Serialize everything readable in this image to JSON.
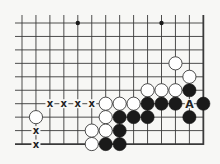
{
  "diagram": {
    "type": "go-board-fragment",
    "columns": 14,
    "rows": 10,
    "edges": {
      "right": true,
      "bottom": true,
      "left": false,
      "top": false
    },
    "colors": {
      "background": "#f7f7f5",
      "line": "#3a3a3a",
      "black_stone": "#1a1a1a",
      "white_stone": "#ffffff",
      "label": "#222222"
    },
    "star_points": [
      [
        4,
        0
      ],
      [
        10,
        0
      ]
    ],
    "white_stones": [
      [
        11,
        3
      ],
      [
        12,
        4
      ],
      [
        9,
        5
      ],
      [
        10,
        5
      ],
      [
        11,
        5
      ],
      [
        6,
        6
      ],
      [
        7,
        6
      ],
      [
        8,
        6
      ],
      [
        6,
        7
      ],
      [
        5,
        8
      ],
      [
        6,
        8
      ],
      [
        5,
        9
      ],
      [
        1,
        7
      ]
    ],
    "black_stones": [
      [
        12,
        5
      ],
      [
        9,
        6
      ],
      [
        10,
        6
      ],
      [
        11,
        6
      ],
      [
        13,
        6
      ],
      [
        7,
        7
      ],
      [
        8,
        7
      ],
      [
        9,
        7
      ],
      [
        12,
        7
      ],
      [
        7,
        8
      ],
      [
        6,
        9
      ],
      [
        7,
        9
      ]
    ],
    "labels": [
      {
        "text": "x",
        "pos": [
          2,
          6
        ]
      },
      {
        "text": "x",
        "pos": [
          3,
          6
        ]
      },
      {
        "text": "x",
        "pos": [
          4,
          6
        ]
      },
      {
        "text": "x",
        "pos": [
          5,
          6
        ]
      },
      {
        "text": "x",
        "pos": [
          1,
          8
        ]
      },
      {
        "text": "x",
        "pos": [
          1,
          9
        ]
      },
      {
        "text": "A",
        "pos": [
          12,
          6
        ]
      }
    ]
  }
}
